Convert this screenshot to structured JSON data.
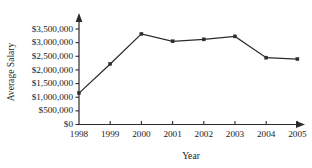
{
  "chart_data": {
    "type": "line",
    "title": "",
    "xlabel": "Year",
    "ylabel": "Average Salary",
    "categories": [
      "1998",
      "1999",
      "2000",
      "2001",
      "2002",
      "2003",
      "2004",
      "2005"
    ],
    "values": [
      1150000,
      2220000,
      3320000,
      3050000,
      3120000,
      3230000,
      2450000,
      2400000
    ],
    "series": [
      {
        "name": "Average Salary",
        "values": [
          1150000,
          2220000,
          3320000,
          3050000,
          3120000,
          3230000,
          2450000,
          2400000
        ]
      }
    ],
    "ylim": [
      0,
      3750000
    ],
    "ytick_values": [
      0,
      500000,
      1000000,
      1500000,
      2000000,
      2500000,
      3000000,
      3500000
    ],
    "ytick_labels": [
      "$0",
      "$500,000",
      "$1,000,000",
      "$1,500,000",
      "$2,000,000",
      "$2,500,000",
      "$3,000,000",
      "$3,500,000"
    ],
    "xtick_labels": [
      "1998",
      "1999",
      "2000",
      "2001",
      "2002",
      "2003",
      "2004",
      "2005"
    ],
    "grid": false,
    "legend": false,
    "legend_position": "none",
    "marker": "square",
    "line_color": "#2b2b2b",
    "axis_color": "#2b2b2b",
    "background_color": "#ffffff"
  },
  "axis": {
    "x_title": "Year",
    "y_title": "Average Salary"
  }
}
